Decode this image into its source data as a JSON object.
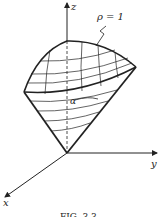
{
  "figure": {
    "caption": "FIG. 3.3",
    "labels": {
      "z_axis": "z",
      "y_axis": "y",
      "x_axis": "x",
      "sphere_label": "ρ = 1",
      "angle_label": "α"
    }
  },
  "colors": {
    "ink": "#222222",
    "background": "#ffffff"
  }
}
